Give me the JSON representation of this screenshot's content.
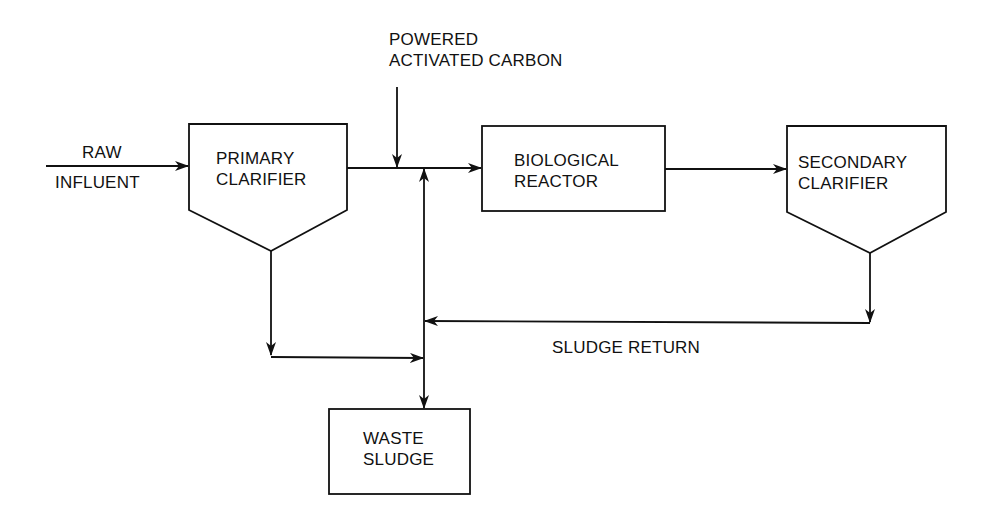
{
  "diagram": {
    "colors": {
      "line": "#111111",
      "background": "#ffffff"
    },
    "nodes": {
      "raw_influent": {
        "line1": "RAW",
        "line2": "INFLUENT"
      },
      "pac": {
        "line1": "POWERED",
        "line2": "ACTIVATED CARBON"
      },
      "primary_clarifier": {
        "line1": "PRIMARY",
        "line2": "CLARIFIER"
      },
      "biological_reactor": {
        "line1": "BIOLOGICAL",
        "line2": "REACTOR"
      },
      "secondary_clarifier": {
        "line1": "SECONDARY",
        "line2": "CLARIFIER"
      },
      "waste_sludge": {
        "line1": "WASTE",
        "line2": "SLUDGE"
      }
    },
    "edge_labels": {
      "sludge_return": "SLUDGE RETURN"
    },
    "edges": [
      {
        "from": "raw_influent",
        "to": "primary_clarifier"
      },
      {
        "from": "primary_clarifier",
        "to": "biological_reactor"
      },
      {
        "from": "pac",
        "to": "biological_reactor"
      },
      {
        "from": "biological_reactor",
        "to": "secondary_clarifier"
      },
      {
        "from": "secondary_clarifier",
        "to": "sludge_return_line"
      },
      {
        "from": "sludge_return_line",
        "to": "biological_reactor"
      },
      {
        "from": "sludge_return_line",
        "to": "waste_sludge"
      },
      {
        "from": "primary_clarifier",
        "to": "waste_sludge"
      }
    ]
  }
}
